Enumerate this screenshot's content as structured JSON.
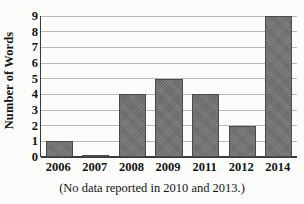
{
  "chart_data": {
    "type": "bar",
    "title": "",
    "subtitle": "",
    "xlabel": "",
    "ylabel": "Number of Words",
    "categories": [
      "2006",
      "2007",
      "2008",
      "2009",
      "2011",
      "2012",
      "2014"
    ],
    "values": [
      1,
      0.1,
      4,
      5,
      4,
      2,
      9
    ],
    "ylim": [
      0,
      9
    ],
    "ytick_labels": [
      "0",
      "1",
      "2",
      "3",
      "4",
      "5",
      "6",
      "7",
      "8",
      "9"
    ],
    "ytick_values": [
      0,
      1,
      2,
      3,
      4,
      5,
      6,
      7,
      8,
      9
    ],
    "grid": true,
    "legend": "none",
    "annotation": "(No data reported in 2010 and 2013.)",
    "bar_color": "#6f6f6f",
    "bar_edge_color": "#4a4a4a",
    "gridline_color": "#b9b9b9",
    "axis_color": "#3b3b3b",
    "background_color": "#fcfcfb"
  },
  "caption": {
    "text": "(No data reported in 2010 and 2013.)"
  }
}
